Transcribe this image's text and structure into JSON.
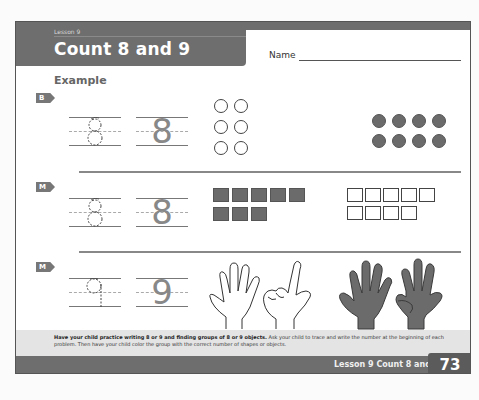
{
  "header": {
    "lesson_label": "Lesson 9",
    "title": "Count 8 and 9",
    "name_label": "Name"
  },
  "example_label": "Example",
  "problems": [
    {
      "tag": "B",
      "digit": "8",
      "trace_digit": "8",
      "groups": [
        {
          "shape": "circle",
          "style": "open",
          "count": 6,
          "layout": "3 rows x 2"
        },
        {
          "shape": "circle",
          "style": "filled",
          "count": 8,
          "layout": "2 rows x 4"
        }
      ]
    },
    {
      "tag": "M",
      "digit": "8",
      "trace_digit": "8",
      "groups": [
        {
          "shape": "square",
          "style": "filled",
          "count": 8,
          "layout": "5 + 3"
        },
        {
          "shape": "square",
          "style": "open",
          "count": 9,
          "layout": "5 + 4"
        }
      ]
    },
    {
      "tag": "M",
      "digit": "9",
      "trace_digit": "9",
      "groups": [
        {
          "shape": "hands",
          "style": "outline",
          "count": 7,
          "description": "open hand and hand showing two fingers"
        },
        {
          "shape": "hands",
          "style": "filled",
          "count": 9,
          "description": "open hand and hand with thumb folded"
        }
      ]
    }
  ],
  "footer": {
    "note_bold": "Have your child practice writing 8 or 9 and finding groups of 8 or 9 objects.",
    "note_rest": " Ask your child to trace and write the number at the beginning of each problem. Then have your child color the group with the correct number of shapes or objects.",
    "copyright": "",
    "title": "Lesson 9 Count 8 and 9",
    "page_number": "73"
  },
  "colors": {
    "band": "#6e6e6e",
    "fill_shape": "#6b6b6b",
    "note_bg": "#e4e4e4"
  }
}
